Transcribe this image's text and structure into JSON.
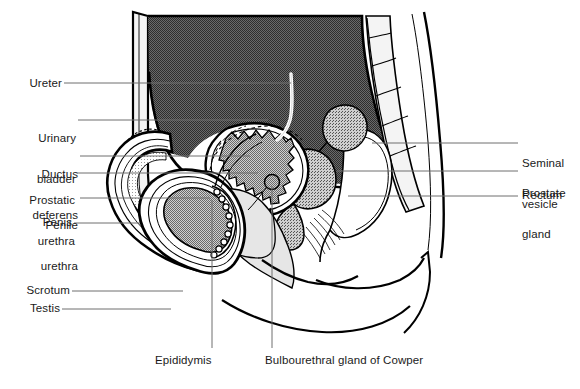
{
  "figure": {
    "width": 580,
    "height": 389,
    "background_color": "#ffffff",
    "line_color": "#000000",
    "leader_color": "#6e6e6e",
    "text_color": "#1a1a1a"
  },
  "labels": {
    "left": [
      {
        "id": "ureter",
        "text": "Ureter",
        "x": 16,
        "y": 77,
        "leader": {
          "x1": 64,
          "y1": 83,
          "x2": 291,
          "y2": 83
        }
      },
      {
        "id": "urinary_bladder",
        "line1": "Urinary",
        "line2": "bladder",
        "x": 16,
        "y": 105,
        "leader": {
          "x1": 78,
          "y1": 120,
          "x2": 268,
          "y2": 120
        }
      },
      {
        "id": "ductus_deferens",
        "line1": "Ductus",
        "line2": "deferens",
        "x": 16,
        "y": 141,
        "leader": {
          "x1": 80,
          "y1": 156,
          "x2": 250,
          "y2": 156
        }
      },
      {
        "id": "prostatic_urethra",
        "line1": "Prostatic",
        "line2": "urethra",
        "x": 16,
        "y": 168,
        "leader": {
          "x1": 77,
          "y1": 173,
          "x2": 258,
          "y2": 173
        }
      },
      {
        "id": "penile_urethra",
        "line1": "Penile",
        "line2": "urethra",
        "x": 16,
        "y": 193,
        "leader": {
          "x1": 80,
          "y1": 198,
          "x2": 210,
          "y2": 198
        }
      },
      {
        "id": "penis",
        "text": "Penis",
        "x": 16,
        "y": 217,
        "leader": {
          "x1": 74,
          "y1": 223,
          "x2": 140,
          "y2": 223
        }
      },
      {
        "id": "scrotum",
        "text": "Scrotum",
        "x": 8,
        "y": 285,
        "leader": {
          "x1": 72,
          "y1": 291,
          "x2": 183,
          "y2": 291
        }
      },
      {
        "id": "testis",
        "text": "Testis",
        "x": 8,
        "y": 303,
        "leader": {
          "x1": 62,
          "y1": 309,
          "x2": 171,
          "y2": 309
        }
      }
    ],
    "right": [
      {
        "id": "seminal_vesicle",
        "line1": "Seminal",
        "line2": "vesicle",
        "x": 522,
        "y": 131,
        "leader": {
          "x1": 372,
          "y1": 143,
          "x2": 518,
          "y2": 143
        }
      },
      {
        "id": "prostate_gland",
        "line1": "Prostate",
        "line2": "gland",
        "x": 522,
        "y": 161,
        "leader": {
          "x1": 337,
          "y1": 171,
          "x2": 518,
          "y2": 171
        }
      },
      {
        "id": "rectum",
        "text": "Rectum",
        "x": 522,
        "y": 190,
        "leader": {
          "x1": 348,
          "y1": 196,
          "x2": 518,
          "y2": 196
        }
      }
    ],
    "bottom": [
      {
        "id": "epididymis",
        "text": "Epididymis",
        "x": 155,
        "y": 355,
        "leader": {
          "x1": 212,
          "y1": 200,
          "x2": 212,
          "y2": 348
        }
      },
      {
        "id": "bulbourethral_gland",
        "text": "Bulbourethral gland of Cowper",
        "x": 265,
        "y": 355,
        "leader": {
          "x1": 272,
          "y1": 186,
          "x2": 272,
          "y2": 348
        }
      }
    ]
  },
  "structures": {
    "abdominal_cavity_fill": "#7c7c7c",
    "bladder_fill": "#9a9a9a",
    "organ_fill_light": "#e8e8e8",
    "organ_fill_mid": "#b4b4b4",
    "testis_fill": "#a0a0a0",
    "bone_fill": "#f2f2f2",
    "white_fill": "#ffffff"
  }
}
